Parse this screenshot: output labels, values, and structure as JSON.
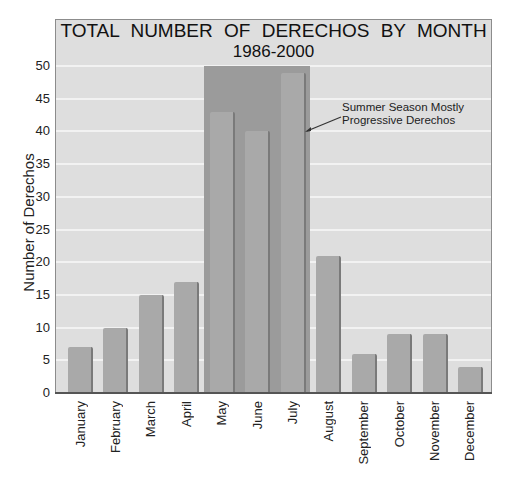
{
  "chart_data": {
    "type": "bar",
    "title": "TOTAL NUMBER OF DERECHOS BY MONTH",
    "subtitle": "1986-2000",
    "xlabel": "",
    "ylabel": "Number of Derechos",
    "ylim": [
      0,
      50
    ],
    "yticks": [
      "0",
      "5",
      "10",
      "15",
      "20",
      "25",
      "30",
      "35",
      "40",
      "45",
      "50"
    ],
    "grid": true,
    "categories": [
      "January",
      "February",
      "March",
      "April",
      "May",
      "June",
      "July",
      "August",
      "September",
      "October",
      "November",
      "December"
    ],
    "values": [
      7,
      10,
      15,
      17,
      43,
      40,
      49,
      21,
      6,
      9,
      9,
      4
    ],
    "highlight": {
      "categories": [
        "May",
        "June",
        "July"
      ],
      "label": "Summer Season Mostly Progressive Derechos"
    },
    "annotation": {
      "line1": "Summer Season Mostly",
      "line2": "Progressive Derechos"
    },
    "colors": {
      "background": "#dedede",
      "bar": "#a9a9a9",
      "highlight": "#9b9b9b",
      "grid": "#f2f2f2"
    }
  }
}
